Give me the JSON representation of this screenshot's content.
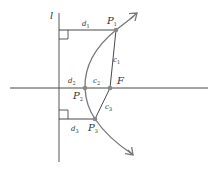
{
  "diagram": {
    "colors": {
      "line": "#333333",
      "curve": "#777777",
      "point": "#888888",
      "background": "#ffffff"
    },
    "labels": {
      "directrix": "l",
      "focus": "F",
      "p1": "P",
      "p1_sub": "1",
      "p2": "P",
      "p2_sub": "2",
      "p3": "P",
      "p3_sub": "3",
      "d1": "d",
      "d1_sub": "1",
      "d2": "d",
      "d2_sub": "2",
      "d3": "d",
      "d3_sub": "3",
      "c1": "c",
      "c1_sub": "1",
      "c2": "c",
      "c2_sub": "2",
      "c3": "c",
      "c3_sub": "3"
    }
  }
}
